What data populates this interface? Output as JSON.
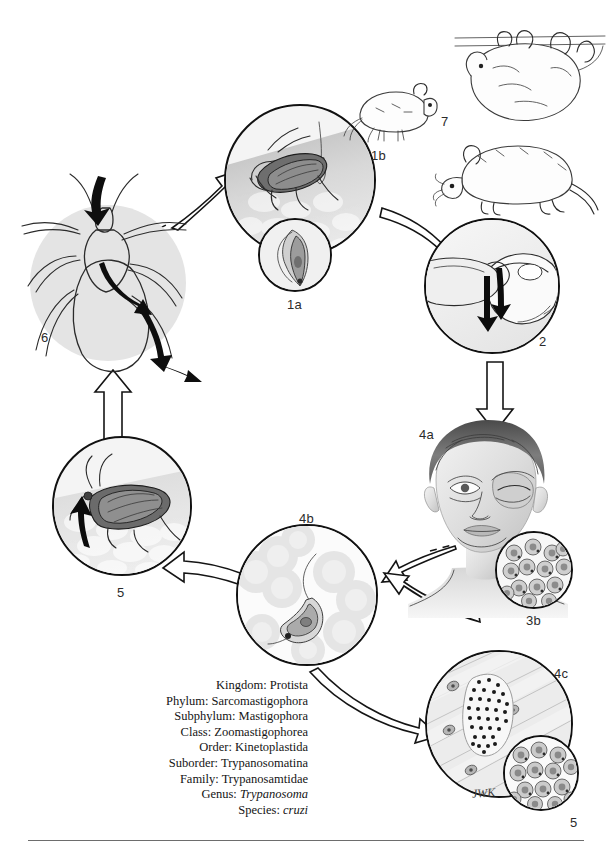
{
  "figure": {
    "signature": "JWK",
    "background_color": "#ffffff",
    "ink_color": "#141414"
  },
  "stage_labels": [
    {
      "id": "1a",
      "text": "1a",
      "description": "metacyclic trypomastigote in bug feces (inset)"
    },
    {
      "id": "1b",
      "text": "1b",
      "description": "reduviid bug taking blood meal and defecating on skin"
    },
    {
      "id": "2",
      "text": "2",
      "description": "infective feces rubbed into the eye / bite wound"
    },
    {
      "id": "3a",
      "text": "3a",
      "description": "amastigotes multiplying inside host cells"
    },
    {
      "id": "3b",
      "text": "3b",
      "description": "child showing unilateral periorbital swelling (Romana sign)"
    },
    {
      "id": "4a",
      "text": "4a",
      "description": "trypomastigote circulating in the bloodstream"
    },
    {
      "id": "4b",
      "text": "4b",
      "description": "pseudocyst packed with amastigotes in muscle tissue"
    },
    {
      "id": "4c",
      "text": "4c",
      "description": "amastigotes (high magnification)"
    },
    {
      "id": "5",
      "text": "5",
      "description": "reduviid bug ingests trypomastigotes with blood meal"
    },
    {
      "id": "6",
      "text": "6",
      "description": "development in the bug hindgut to metacyclic trypomastigotes"
    },
    {
      "id": "7",
      "text": "7",
      "description": "animal reservoir hosts"
    }
  ],
  "taxonomy": [
    {
      "rank": "Kingdom:",
      "name": "Protista",
      "italic": false
    },
    {
      "rank": "Phylum:",
      "name": "Sarcomastigophora",
      "italic": false
    },
    {
      "rank": "Subphylum:",
      "name": "Mastigophora",
      "italic": false
    },
    {
      "rank": "Class:",
      "name": "Zoomastigophorea",
      "italic": false
    },
    {
      "rank": "Order:",
      "name": "Kinetoplastida",
      "italic": false
    },
    {
      "rank": "Suborder:",
      "name": "Trypanosomatina",
      "italic": false
    },
    {
      "rank": "Family:",
      "name": "Trypanosamtidae",
      "italic": false
    },
    {
      "rank": "Genus:",
      "name": "Trypanosoma",
      "italic": true
    },
    {
      "rank": "Species:",
      "name": "cruzi",
      "italic": true
    }
  ],
  "taxonomy_lines": {
    "l0": "Kingdom: Protista",
    "l1": "Phylum: Sarcomastigophora",
    "l2": "Subphylum: Mastigophora",
    "l3": "Class: Zoomastigophorea",
    "l4": "Order: Kinetoplastida",
    "l5": "Suborder: Trypanosomatina",
    "l6": "Family: Trypanosamtidae",
    "l7_rank": "Genus:",
    "l7_name": "Trypanosoma",
    "l8_rank": "Species:",
    "l8_name": "cruzi"
  }
}
